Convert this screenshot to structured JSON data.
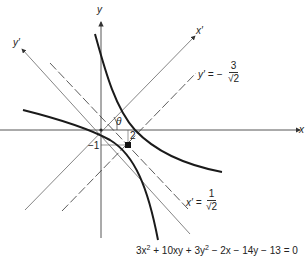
{
  "figure": {
    "type": "rotated-conic-hyperbola",
    "axes": {
      "x_label": "x",
      "y_label": "y",
      "x_prime_label": "x′",
      "y_prime_label": "y′"
    },
    "angle_label": "θ",
    "tick_labels": {
      "y_tick": "2",
      "x_tick": "−1"
    },
    "asymptote_labels": {
      "y_prime": {
        "lhs": "y′ = −",
        "numerator": "3",
        "denominator": "√2"
      },
      "x_prime": {
        "lhs": "x′ =",
        "numerator": "1",
        "denominator": "√2"
      }
    },
    "equation": {
      "parts": [
        "3x",
        "2",
        " + 10xy + 3y",
        "2",
        " − 2x − 14y − 13 = 0"
      ]
    },
    "center_point": {
      "x": -1,
      "y": 2
    },
    "colors": {
      "curve": "#1a1a1a",
      "axis": "#444444",
      "rotated_axis": "#666666",
      "dashed": "#333333",
      "background": "#ffffff"
    }
  }
}
